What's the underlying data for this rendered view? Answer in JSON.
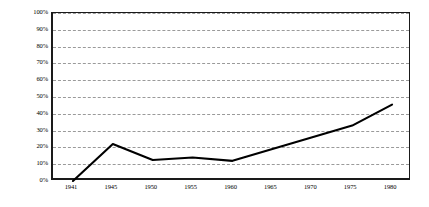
{
  "chart_data": {
    "type": "line",
    "title": "",
    "subtitle": "",
    "xlabel": "",
    "ylabel": "",
    "categories": [
      "1941",
      "1945",
      "1950",
      "1955",
      "1960",
      "1965",
      "1970",
      "1975",
      "1980"
    ],
    "x": [
      1941,
      1945,
      1950,
      1955,
      1960,
      1965,
      1970,
      1975,
      1980
    ],
    "values": [
      0,
      22,
      12.5,
      14,
      12,
      19,
      26,
      33,
      45.5
    ],
    "series": [
      {
        "name": "",
        "values": [
          0,
          22,
          12.5,
          14,
          12,
          19,
          26,
          33,
          45.5
        ]
      }
    ],
    "ylim": [
      0,
      100
    ],
    "ytick_values": [
      0,
      10,
      20,
      30,
      40,
      50,
      60,
      70,
      80,
      90,
      100
    ],
    "ytick_labels": [
      "0%",
      "10%",
      "20%",
      "30%",
      "40%",
      "50%",
      "60%",
      "70%",
      "80%",
      "90%",
      "100%"
    ],
    "xtick_labels": [
      "1941",
      "1945",
      "1950",
      "1955",
      "1960",
      "1965",
      "1970",
      "1975",
      "1980"
    ],
    "grid": "horizontal-dashed",
    "grid_color": "#9a9a9a",
    "legend": "none",
    "legend_entries": [],
    "annotations": [],
    "line_color": "#000000",
    "background_color": "#ffffff",
    "axis_color": "#1a1a1a",
    "markers": "none"
  }
}
